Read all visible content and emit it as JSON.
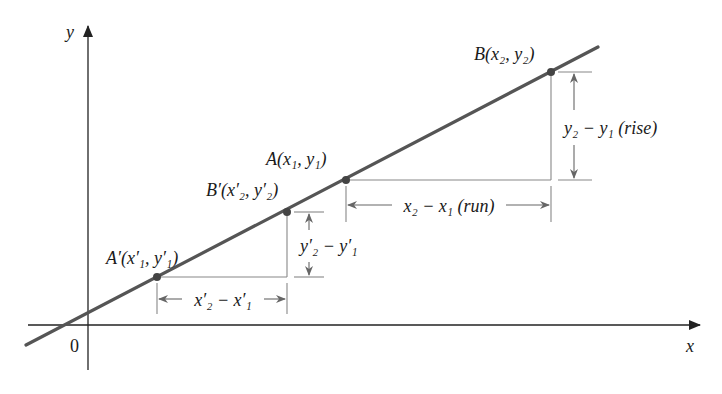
{
  "diagram": {
    "colors": {
      "line": "#555555",
      "axis": "#222222",
      "guide": "#888888",
      "point": "#444444",
      "text": "#1a1a1a"
    },
    "axes": {
      "x_label": "x",
      "y_label": "y",
      "origin_label": "0"
    },
    "points": [
      {
        "id": "A_prime",
        "name": "A′",
        "coords_text": "(x′₁, y′₁)",
        "px": [
          157,
          277
        ]
      },
      {
        "id": "B_prime",
        "name": "B′",
        "coords_text": "(x′₂, y′₂)",
        "px": [
          287,
          212
        ]
      },
      {
        "id": "A",
        "name": "A",
        "coords_text": "(x₁, y₁)",
        "px": [
          346,
          180
        ]
      },
      {
        "id": "B",
        "name": "B",
        "coords_text": "(x₂, y₂)",
        "px": [
          551,
          72
        ]
      }
    ],
    "labels": {
      "A_prime": "A′(x′₁, y′₁)",
      "B_prime": "B′(x′₂, y′₂)",
      "A": "A(x₁, y₁)",
      "B": "B(x₂, y₂)",
      "run_main": "x₂ − x₁ (run)",
      "rise_main": "y₂ − y₁ (rise)",
      "run_prime": "x′₂ − x′₁",
      "rise_prime": "y′₂ − y′₁"
    }
  }
}
